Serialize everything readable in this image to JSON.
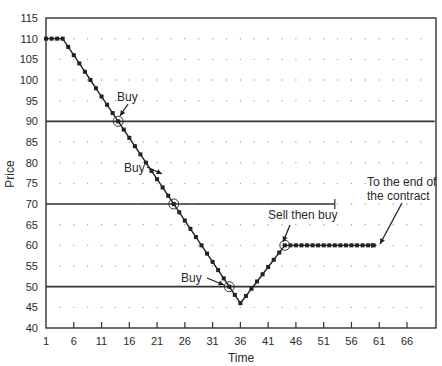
{
  "chart_data": {
    "type": "line",
    "title": "",
    "xlabel": "Time",
    "ylabel": "Price",
    "xlim": [
      1,
      71
    ],
    "ylim": [
      40,
      115
    ],
    "x_ticks": [
      1,
      6,
      11,
      16,
      21,
      26,
      31,
      36,
      41,
      46,
      51,
      56,
      61,
      66
    ],
    "y_ticks": [
      40,
      45,
      50,
      55,
      60,
      65,
      70,
      75,
      80,
      85,
      90,
      95,
      100,
      105,
      110,
      115
    ],
    "grid": "dotted",
    "legend": "none",
    "reference_lines": [
      {
        "price": 90,
        "x_start": 1,
        "x_end": 71
      },
      {
        "price": 70,
        "x_start": 1,
        "x_end": 53,
        "end_tick": true
      },
      {
        "price": 50,
        "x_start": 1,
        "x_end": 71
      }
    ],
    "series": [
      {
        "name": "Price path",
        "x": [
          1,
          2,
          3,
          4,
          5,
          6,
          7,
          8,
          9,
          10,
          11,
          12,
          13,
          14,
          15,
          16,
          17,
          18,
          19,
          20,
          21,
          22,
          23,
          24,
          25,
          26,
          27,
          28,
          29,
          30,
          31,
          32,
          33,
          34,
          35,
          36,
          37,
          38,
          39,
          40,
          41,
          42,
          43,
          44,
          45,
          46,
          47,
          48,
          49,
          50,
          51,
          52,
          53,
          54,
          55,
          56,
          57,
          58,
          59,
          60
        ],
        "values": [
          110,
          110,
          110,
          110,
          108,
          106,
          104,
          102,
          100,
          98,
          96,
          94,
          92,
          90,
          88,
          86,
          84,
          82,
          80,
          78,
          76,
          74,
          72,
          70,
          68,
          66,
          64,
          62,
          60,
          58,
          56,
          54,
          52,
          50,
          48,
          46,
          47.75,
          49.5,
          51.25,
          53,
          54.75,
          56.5,
          58.25,
          60,
          60,
          60,
          60,
          60,
          60,
          60,
          60,
          60,
          60,
          60,
          60,
          60,
          60,
          60,
          60,
          60
        ]
      }
    ],
    "annotations": [
      {
        "text": "Buy",
        "x": 14,
        "y": 90,
        "circled": true
      },
      {
        "text": "Buy",
        "x": 24,
        "y": 70,
        "circled": true
      },
      {
        "text": "Buy",
        "x": 34,
        "y": 50,
        "circled": true
      },
      {
        "text": "Sell then buy",
        "x": 44,
        "y": 60,
        "circled": true
      },
      {
        "text": "To the end of the contract",
        "x": 60,
        "y": 60,
        "arrow": true
      }
    ]
  },
  "labels": {
    "xlabel": "Time",
    "ylabel": "Price",
    "buy1": "Buy",
    "buy2": "Buy",
    "buy3": "Buy",
    "sell_then_buy": "Sell then buy",
    "end_line1": "To the end of",
    "end_line2": "the contract"
  }
}
